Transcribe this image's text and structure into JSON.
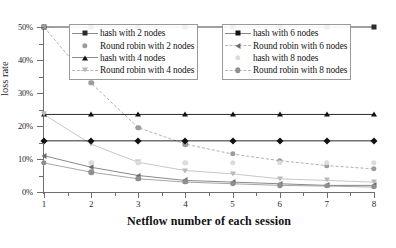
{
  "chart_data": {
    "type": "line",
    "title": "",
    "xlabel": "Netflow number of each session",
    "ylabel": "loss rate",
    "x": [
      1,
      2,
      3,
      4,
      5,
      6,
      7,
      8
    ],
    "xlim": [
      1,
      8
    ],
    "ylim": [
      0,
      50
    ],
    "yunit": "%",
    "y_tick_labels": [
      "0%",
      "10%",
      "20%",
      "30%",
      "40%",
      "50%"
    ],
    "y_major_ticks": [
      0,
      10,
      20,
      30,
      40,
      50
    ],
    "y_minor_ticks": [
      5,
      15,
      25,
      35,
      45
    ],
    "x_tick_labels": [
      "1",
      "2",
      "3",
      "4",
      "5",
      "6",
      "7",
      "8"
    ],
    "grid": false,
    "legend_position": "top",
    "series": [
      {
        "name": "hash with 2 nodes",
        "marker": "square",
        "line": "solid",
        "color": "#2b2b2b",
        "values": [
          50,
          50,
          50,
          50,
          50,
          50,
          50,
          50
        ]
      },
      {
        "name": "Round robin with 2 nodes",
        "marker": "circle-grey",
        "line": "dashed",
        "color": "#9c9c9c",
        "values": [
          50,
          33,
          19.5,
          14.5,
          11.5,
          9.5,
          8,
          7
        ]
      },
      {
        "name": "hash with 4 nodes",
        "marker": "tri-up",
        "line": "solid",
        "color": "#111111",
        "values": [
          23.5,
          23.5,
          23.5,
          23.5,
          23.5,
          23.5,
          23.5,
          23.5
        ]
      },
      {
        "name": "Round robin with 4 nodes",
        "marker": "tri-down",
        "line": "solid",
        "color": "#b9b9b9",
        "values": [
          23.5,
          14.5,
          9,
          6.5,
          5.5,
          4,
          3.5,
          3
        ]
      },
      {
        "name": "hash with 6 nodes",
        "marker": "diamond",
        "line": "solid",
        "color": "#111111",
        "values": [
          15.5,
          15.5,
          15.5,
          15.5,
          15.5,
          15.5,
          15.5,
          15.5
        ]
      },
      {
        "name": "Round robin with 6 nodes",
        "marker": "tri-left",
        "line": "solid",
        "color": "#6b6b6b",
        "values": [
          11,
          7.5,
          5,
          3.5,
          3,
          2.5,
          2,
          2
        ]
      },
      {
        "name": "hash with 8 nodes",
        "marker": "star",
        "line": "none",
        "color": "#dcdcdc",
        "values": [
          8.8,
          8.8,
          8.8,
          8.8,
          8.8,
          8.8,
          8.8,
          8.8
        ]
      },
      {
        "name": "Round robin with 8 nodes",
        "marker": "circle-mid",
        "line": "solid",
        "color": "#8f8f8f",
        "values": [
          8.8,
          6,
          4,
          3,
          2.5,
          2,
          1.8,
          1.5
        ]
      }
    ]
  },
  "legend": {
    "left_column": [
      {
        "label": "hash with 2 nodes"
      },
      {
        "label": "Round robin with 2 nodes"
      },
      {
        "label": "hash with 4 nodes"
      },
      {
        "label": "Round robin with 4 nodes"
      }
    ],
    "right_column": [
      {
        "label": "hash with 6 nodes"
      },
      {
        "label": "Round robin with 6 nodes"
      },
      {
        "label": "hash with 8 nodes"
      },
      {
        "label": "Round robin with 8 nodes"
      }
    ]
  }
}
